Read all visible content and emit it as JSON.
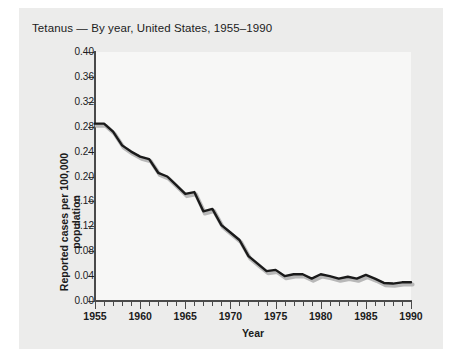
{
  "figure": {
    "title": "Tetanus — By year, United States, 1955–1990",
    "background_color": "#ececeb",
    "plot_background_color": "#f7f7f6",
    "line_color": "#1a1a1a",
    "shadow_color": "#b8b8b8"
  },
  "chart_data": {
    "type": "line",
    "title": "Tetanus — By year, United States, 1955–1990",
    "xlabel": "Year",
    "ylabel": "Reported cases per 100,000 population",
    "xlim": [
      1955,
      1990
    ],
    "ylim": [
      0.0,
      0.4
    ],
    "grid": false,
    "legend": "none",
    "x_tick_labels": [
      "1955",
      "1960",
      "1965",
      "1970",
      "1975",
      "1980",
      "1985",
      "1990"
    ],
    "x_major_ticks": [
      1955,
      1960,
      1965,
      1970,
      1975,
      1980,
      1985,
      1990
    ],
    "x_minor_tick_interval": 1,
    "y_tick_labels": [
      "0.00",
      "0.04",
      "0.08",
      "0.12",
      "0.16",
      "0.20",
      "0.24",
      "0.28",
      "0.32",
      "0.36",
      "0.40"
    ],
    "y_ticks": [
      0.0,
      0.04,
      0.08,
      0.12,
      0.16,
      0.2,
      0.24,
      0.28,
      0.32,
      0.36,
      0.4
    ],
    "x": [
      1955,
      1956,
      1957,
      1958,
      1959,
      1960,
      1961,
      1962,
      1963,
      1964,
      1965,
      1966,
      1967,
      1968,
      1969,
      1970,
      1971,
      1972,
      1973,
      1974,
      1975,
      1976,
      1977,
      1978,
      1979,
      1980,
      1981,
      1982,
      1983,
      1984,
      1985,
      1986,
      1987,
      1988,
      1989,
      1990
    ],
    "values": [
      0.285,
      0.285,
      0.272,
      0.25,
      0.24,
      0.232,
      0.228,
      0.206,
      0.2,
      0.186,
      0.172,
      0.175,
      0.144,
      0.148,
      0.122,
      0.11,
      0.098,
      0.072,
      0.06,
      0.048,
      0.05,
      0.04,
      0.043,
      0.043,
      0.036,
      0.043,
      0.04,
      0.036,
      0.039,
      0.036,
      0.042,
      0.036,
      0.029,
      0.028,
      0.03,
      0.03
    ],
    "series": [
      {
        "name": "Reported tetanus cases per 100,000 population",
        "values": [
          0.285,
          0.285,
          0.272,
          0.25,
          0.24,
          0.232,
          0.228,
          0.206,
          0.2,
          0.186,
          0.172,
          0.175,
          0.144,
          0.148,
          0.122,
          0.11,
          0.098,
          0.072,
          0.06,
          0.048,
          0.05,
          0.04,
          0.043,
          0.043,
          0.036,
          0.043,
          0.04,
          0.036,
          0.039,
          0.036,
          0.042,
          0.036,
          0.029,
          0.028,
          0.03,
          0.03
        ]
      }
    ]
  }
}
